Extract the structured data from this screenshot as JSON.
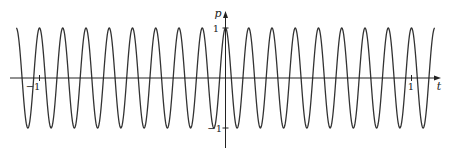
{
  "chart_data": {
    "type": "line",
    "title": "",
    "function": "p = cos(16*pi*t)",
    "xlabel": "t",
    "ylabel": "p",
    "xlim": [
      -1.125,
      1.125
    ],
    "ylim": [
      -1,
      1
    ],
    "x_ticks": [
      {
        "value": -1,
        "label": "−1"
      },
      {
        "value": 1,
        "label": "1"
      }
    ],
    "y_ticks": [
      {
        "value": 1,
        "label": "1"
      },
      {
        "value": -1,
        "label": "−1"
      }
    ],
    "series": [
      {
        "name": "p(t)",
        "amplitude": 1,
        "frequency": 8,
        "period": 0.125,
        "phase": 0,
        "color": "#333333"
      }
    ],
    "grid": false,
    "legend": null
  },
  "axes": {
    "x_label": "t",
    "y_label": "p",
    "x_tick_neg": "−1",
    "x_tick_pos": "1",
    "y_tick_pos": "1",
    "y_tick_neg": "−1"
  },
  "colors": {
    "curve": "#333333",
    "axis": "#222222",
    "background": "#ffffff"
  }
}
